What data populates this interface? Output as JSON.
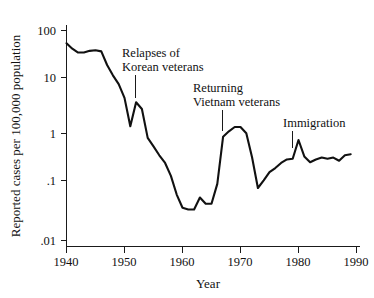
{
  "chart_data": {
    "type": "line",
    "title": "",
    "xlabel": "Year",
    "ylabel": "Reported cases per 100,000 population",
    "yscale": "log",
    "xlim": [
      1940,
      1990
    ],
    "ylim": [
      0.01,
      100
    ],
    "grid": false,
    "legend": "none",
    "x_ticks": [
      "1940",
      "1950",
      "1960",
      "1970",
      "1980",
      "1990"
    ],
    "x_tick_values": [
      1940,
      1950,
      1960,
      1970,
      1980,
      1990
    ],
    "y_ticks": [
      "100",
      "10",
      "1",
      ".1",
      ".01"
    ],
    "y_tick_values": [
      100,
      10,
      1,
      0.1,
      0.01
    ],
    "series": [
      {
        "name": "Reported cases per 100,000 population",
        "color": "#111111",
        "x": [
          1940,
          1941,
          1942,
          1943,
          1944,
          1945,
          1946,
          1947,
          1948,
          1949,
          1950,
          1951,
          1952,
          1953,
          1954,
          1955,
          1956,
          1957,
          1958,
          1959,
          1960,
          1961,
          1962,
          1963,
          1964,
          1965,
          1966,
          1967,
          1968,
          1969,
          1970,
          1971,
          1972,
          1973,
          1974,
          1975,
          1976,
          1977,
          1978,
          1979,
          1980,
          1981,
          1982,
          1983,
          1984,
          1985,
          1986,
          1987,
          1988,
          1989
        ],
        "values": [
          57,
          45,
          38,
          38,
          41,
          42,
          40,
          22,
          14,
          9.5,
          5.2,
          1.5,
          4.3,
          3.2,
          0.9,
          0.62,
          0.42,
          0.3,
          0.17,
          0.075,
          0.042,
          0.039,
          0.039,
          0.066,
          0.05,
          0.05,
          0.12,
          0.95,
          1.2,
          1.45,
          1.45,
          1.1,
          0.38,
          0.1,
          0.14,
          0.2,
          0.24,
          0.3,
          0.35,
          0.36,
          0.82,
          0.4,
          0.31,
          0.35,
          0.38,
          0.36,
          0.38,
          0.33,
          0.42,
          0.44
        ]
      }
    ],
    "annotations": [
      {
        "id": "relapses-korean",
        "lines": [
          "Relapses of",
          "Korean veterans"
        ],
        "target_x": 1951.5,
        "target_y": 4.0
      },
      {
        "id": "returning-vietnam",
        "lines": [
          "Returning",
          "Vietnam veterans"
        ],
        "target_x": 1967.0,
        "target_y": 1.0
      },
      {
        "id": "immigration",
        "lines": [
          "Immigration"
        ],
        "target_x": 1979.0,
        "target_y": 0.5
      }
    ]
  },
  "axes": {
    "y_title": "Reported cases per 100,000 population",
    "x_title": "Year",
    "y_labels": {
      "l0": "100",
      "l1": "10",
      "l2": "1",
      "l3": ".1",
      "l4": ".01"
    },
    "x_labels": {
      "t0": "1940",
      "t1": "1950",
      "t2": "1960",
      "t3": "1970",
      "t4": "1980",
      "t5": "1990"
    }
  },
  "annotations_text": {
    "a0_line1": "Relapses of",
    "a0_line2": "Korean veterans",
    "a1_line1": "Returning",
    "a1_line2": "Vietnam veterans",
    "a2_line1": "Immigration"
  },
  "colors": {
    "line": "#111111",
    "axis": "#1a1a1a",
    "background": "#ffffff"
  }
}
